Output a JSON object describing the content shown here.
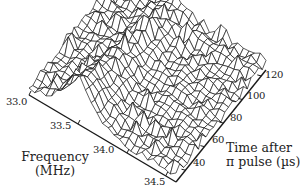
{
  "chart_data": {
    "type": "surface3d",
    "title": "",
    "x_axis": {
      "label_line1": "Frequency",
      "label_line2": "(MHz)",
      "range": [
        33.0,
        34.5
      ],
      "ticks": [
        "33.0",
        "33.5",
        "34.0",
        "34.5"
      ]
    },
    "y_axis": {
      "label_line1": "Time after",
      "label_line2": "π pulse (µs)",
      "range": [
        30,
        125
      ],
      "ticks": [
        "40",
        "60",
        "80",
        "100",
        "120"
      ]
    },
    "z_axis": {
      "label": "",
      "ticks": []
    },
    "peak": {
      "frequency_mhz": 33.5,
      "time_us": 50
    },
    "grid_lines": "wireframe mesh",
    "legend": null
  },
  "colors": {
    "line": "#1a1a1a",
    "background": "#ffffff"
  }
}
